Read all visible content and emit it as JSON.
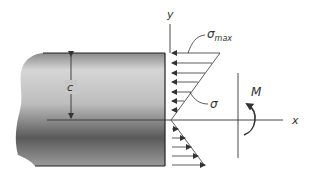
{
  "diagram": {
    "labels": {
      "y_axis": "y",
      "x_axis": "x",
      "sigma_max": "σ",
      "sigma_max_sub": "max",
      "sigma": "σ",
      "moment": "M",
      "distance": "c"
    },
    "colors": {
      "line": "#333333",
      "beam_light": "#d8d8d8",
      "beam_dark": "#4a4a4a",
      "background": "#ffffff"
    }
  }
}
